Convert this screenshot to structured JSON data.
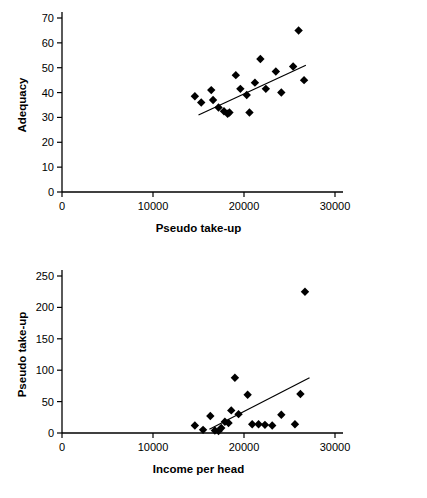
{
  "chart_data": [
    {
      "id": "top",
      "type": "scatter",
      "title": "",
      "xlabel": "Pseudo take-up",
      "ylabel": "Adequacy",
      "xlim": [
        0,
        30000
      ],
      "ylim": [
        0,
        70
      ],
      "xticks": [
        0,
        10000,
        20000,
        30000
      ],
      "xticklabels": [
        "0",
        "10000",
        "20000",
        "30000"
      ],
      "yticks": [
        0,
        10,
        20,
        30,
        40,
        50,
        60,
        70
      ],
      "yticklabels": [
        "0",
        "10",
        "20",
        "30",
        "40",
        "50",
        "60",
        "70"
      ],
      "grid": false,
      "legend": false,
      "marker": "diamond",
      "points": [
        [
          14600,
          38.5
        ],
        [
          15300,
          36.0
        ],
        [
          16400,
          41.0
        ],
        [
          16600,
          37.0
        ],
        [
          17200,
          34.0
        ],
        [
          17800,
          32.5
        ],
        [
          18200,
          31.5
        ],
        [
          18400,
          32.0
        ],
        [
          19100,
          47.0
        ],
        [
          19600,
          41.5
        ],
        [
          20300,
          39.0
        ],
        [
          20600,
          32.0
        ],
        [
          21200,
          44.0
        ],
        [
          21800,
          53.5
        ],
        [
          22400,
          41.5
        ],
        [
          23500,
          48.5
        ],
        [
          24100,
          40.0
        ],
        [
          25400,
          50.5
        ],
        [
          26000,
          65.0
        ],
        [
          26600,
          45.0
        ]
      ],
      "trendline": {
        "x0": 15000,
        "y0": 31.0,
        "x1": 26800,
        "y1": 51.0
      }
    },
    {
      "id": "bottom",
      "type": "scatter",
      "title": "",
      "xlabel": "Income per head",
      "ylabel": "Pseudo take-up",
      "xlim": [
        0,
        30000
      ],
      "ylim": [
        0,
        250
      ],
      "xticks": [
        0,
        10000,
        20000,
        30000
      ],
      "xticklabels": [
        "0",
        "10000",
        "20000",
        "30000"
      ],
      "yticks": [
        0,
        50,
        100,
        150,
        200,
        250
      ],
      "yticklabels": [
        "0",
        "50",
        "100",
        "150",
        "200",
        "250"
      ],
      "grid": false,
      "legend": false,
      "marker": "diamond",
      "points": [
        [
          14600,
          12.0
        ],
        [
          15500,
          5.0
        ],
        [
          16300,
          27.0
        ],
        [
          16800,
          4.0
        ],
        [
          17200,
          3.0
        ],
        [
          17500,
          8.0
        ],
        [
          17900,
          18.0
        ],
        [
          18300,
          16.0
        ],
        [
          18600,
          36.0
        ],
        [
          19000,
          88.0
        ],
        [
          19400,
          30.0
        ],
        [
          20400,
          61.0
        ],
        [
          20900,
          14.0
        ],
        [
          21600,
          14.0
        ],
        [
          22300,
          13.0
        ],
        [
          23100,
          12.0
        ],
        [
          24100,
          29.0
        ],
        [
          25600,
          14.0
        ],
        [
          26200,
          62.0
        ],
        [
          26700,
          225.0
        ]
      ],
      "trendline": {
        "x0": 16200,
        "y0": 6.0,
        "x1": 27200,
        "y1": 88.0
      }
    }
  ]
}
